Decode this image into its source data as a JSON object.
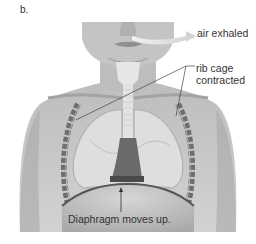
{
  "figure": {
    "panel_label": "b.",
    "labels": {
      "air": "air exhaled",
      "rib_line1": "rib cage",
      "rib_line2": "contracted",
      "diaphragm": "Diaphragm moves up."
    },
    "colors": {
      "skin": "#c9c9c9",
      "skin_dark": "#9a9a9a",
      "lung": "#d8d8d8",
      "rib": "#6e6e6e",
      "heart": "#5a5a5a",
      "arrow": "#d4d4d4",
      "leader_line": "#444444",
      "text": "#333333"
    }
  }
}
